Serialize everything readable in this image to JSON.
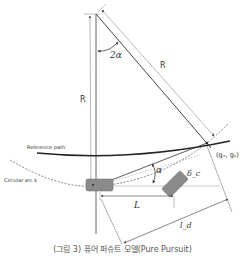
{
  "diagram": {
    "labels": {
      "radius_vertical": "R",
      "radius_diagonal": "R",
      "angle_center": "2α",
      "angle_heading": "α",
      "goal_point": "(gₓ, gᵧ)",
      "reference_path": "Reference path",
      "circular_arc": "Circular arc k",
      "wheelbase": "L",
      "lookahead": "l_d",
      "steering_angle": "δ_c"
    },
    "colors": {
      "line": "#444444",
      "light_line": "#999999",
      "path": "#222222",
      "vehicle_fill": "#8a8a8a",
      "vehicle_stroke": "#666666"
    }
  },
  "caption": "(그림 3) 퓨어 퍼슈트 모델(Pure Pursuit)"
}
